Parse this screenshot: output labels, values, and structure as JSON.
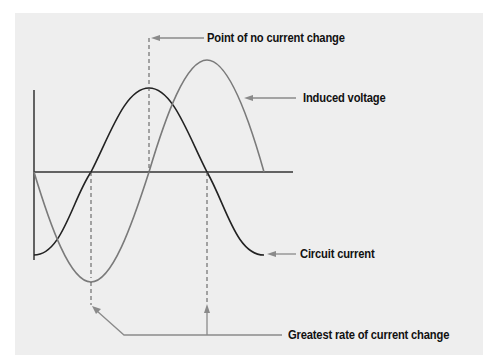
{
  "diagram": {
    "type": "phase relationship of circuit current and induced voltage (sine waves)",
    "colors": {
      "background": "#eeeeee",
      "circuit_current": "#222222",
      "induced_voltage": "#7a7a7a",
      "axis": "#333333",
      "leader": "#8a8a8a"
    },
    "labels": {
      "point_of_no_change": "Point of no current change",
      "induced_voltage": "Induced voltage",
      "circuit_current": "Circuit current",
      "greatest_rate": "Greatest rate of current change"
    },
    "curves": [
      {
        "name": "Circuit current",
        "shape": "negative cosine, starts at minimum, peaks at no-current-change point"
      },
      {
        "name": "Induced voltage",
        "shape": "negative sine, lags current by 90 degrees, larger amplitude"
      }
    ]
  }
}
